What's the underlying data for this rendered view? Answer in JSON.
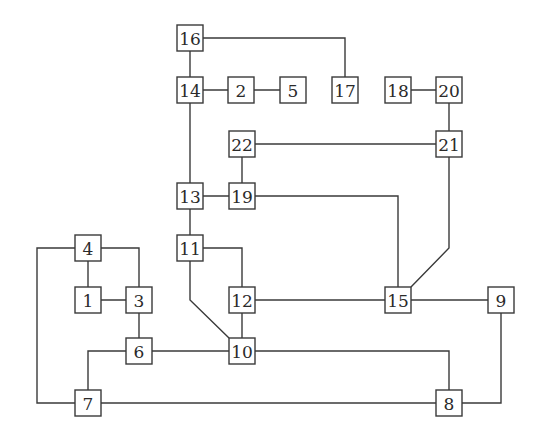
{
  "diagram": {
    "type": "graph",
    "colors": {
      "background": "#ffffff",
      "stroke": "#3a3a3a",
      "text": "#2a2a2a"
    },
    "nodes": [
      {
        "id": "1",
        "label": "1"
      },
      {
        "id": "2",
        "label": "2"
      },
      {
        "id": "3",
        "label": "3"
      },
      {
        "id": "4",
        "label": "4"
      },
      {
        "id": "5",
        "label": "5"
      },
      {
        "id": "6",
        "label": "6"
      },
      {
        "id": "7",
        "label": "7"
      },
      {
        "id": "8",
        "label": "8"
      },
      {
        "id": "9",
        "label": "9"
      },
      {
        "id": "10",
        "label": "10"
      },
      {
        "id": "11",
        "label": "11"
      },
      {
        "id": "12",
        "label": "12"
      },
      {
        "id": "13",
        "label": "13"
      },
      {
        "id": "14",
        "label": "14"
      },
      {
        "id": "15",
        "label": "15"
      },
      {
        "id": "16",
        "label": "16"
      },
      {
        "id": "17",
        "label": "17"
      },
      {
        "id": "18",
        "label": "18"
      },
      {
        "id": "19",
        "label": "19"
      },
      {
        "id": "20",
        "label": "20"
      },
      {
        "id": "21",
        "label": "21"
      },
      {
        "id": "22",
        "label": "22"
      }
    ],
    "edges": [
      {
        "from": "16",
        "to": "14"
      },
      {
        "from": "16",
        "to": "17"
      },
      {
        "from": "14",
        "to": "2"
      },
      {
        "from": "2",
        "to": "5"
      },
      {
        "from": "14",
        "to": "13"
      },
      {
        "from": "18",
        "to": "20"
      },
      {
        "from": "20",
        "to": "21"
      },
      {
        "from": "22",
        "to": "21"
      },
      {
        "from": "22",
        "to": "19"
      },
      {
        "from": "13",
        "to": "19"
      },
      {
        "from": "13",
        "to": "11"
      },
      {
        "from": "19",
        "to": "15"
      },
      {
        "from": "21",
        "to": "15"
      },
      {
        "from": "11",
        "to": "12"
      },
      {
        "from": "11",
        "to": "10"
      },
      {
        "from": "12",
        "to": "10"
      },
      {
        "from": "12",
        "to": "15"
      },
      {
        "from": "15",
        "to": "9"
      },
      {
        "from": "4",
        "to": "1"
      },
      {
        "from": "4",
        "to": "3"
      },
      {
        "from": "4",
        "to": "7"
      },
      {
        "from": "1",
        "to": "3"
      },
      {
        "from": "3",
        "to": "6"
      },
      {
        "from": "6",
        "to": "10"
      },
      {
        "from": "6",
        "to": "7"
      },
      {
        "from": "10",
        "to": "8"
      },
      {
        "from": "7",
        "to": "8"
      },
      {
        "from": "9",
        "to": "8"
      }
    ]
  }
}
